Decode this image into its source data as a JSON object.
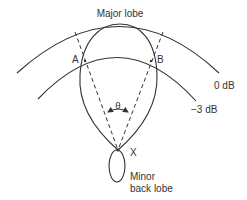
{
  "diagram": {
    "labels": {
      "major_lobe": "Major lobe",
      "point_a": "A",
      "point_b": "B",
      "zero_db": "0 dB",
      "minus_three_db": "−3 dB",
      "theta": "θ",
      "origin": "X",
      "minor_lobe_line1": "Minor",
      "minor_lobe_line2": "back lobe"
    },
    "colors": {
      "stroke": "#333333",
      "background": "#ffffff"
    }
  }
}
